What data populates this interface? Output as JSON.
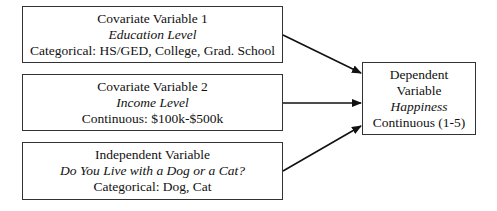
{
  "diagram": {
    "nodes": [
      {
        "id": "covariate-1",
        "role": "Covariate Variable 1",
        "name": "Education Level",
        "type": "Categorical: HS/GED, College, Grad. School"
      },
      {
        "id": "covariate-2",
        "role": "Covariate Variable 2",
        "name": "Income Level",
        "type": "Continuous: $100k-$500k"
      },
      {
        "id": "independent",
        "role": "Independent Variable",
        "name": "Do You Live with a Dog or a Cat?",
        "type": "Categorical: Dog, Cat"
      },
      {
        "id": "dependent",
        "role_line1": "Dependent",
        "role_line2": "Variable",
        "name": "Happiness",
        "type": "Continuous (1-5)"
      }
    ],
    "edges": [
      {
        "from": "covariate-1",
        "to": "dependent"
      },
      {
        "from": "covariate-2",
        "to": "dependent"
      },
      {
        "from": "independent",
        "to": "dependent"
      }
    ],
    "colors": {
      "border": "#333333",
      "arrow": "#111111",
      "background": "#ffffff"
    }
  }
}
